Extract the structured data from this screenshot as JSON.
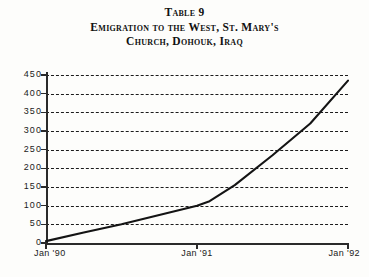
{
  "title": {
    "line1": "Table 9",
    "line2": "Emigration to the West, St. Mary's",
    "line3": "Church, Dohouk, Iraq"
  },
  "colors": {
    "line": "#141414",
    "grid": "#1b1b1b",
    "axis": "#2a2a2a",
    "background": "#fdfdfb",
    "text": "#111111"
  },
  "chart_data": {
    "type": "line",
    "title": "Emigration to the West, St. Mary's Church, Dohouk, Iraq",
    "table_number": "Table 9",
    "xlabel": "",
    "ylabel": "",
    "xlim": [
      "Jan '90",
      "Jan '92"
    ],
    "ylim": [
      0,
      450
    ],
    "ytick_labels": [
      "0",
      "50",
      "100",
      "150",
      "200",
      "250",
      "300",
      "350",
      "400",
      "450"
    ],
    "yticks": [
      0,
      50,
      100,
      150,
      200,
      250,
      300,
      350,
      400,
      450
    ],
    "xtick_labels": [
      "Jan '90",
      "Jan '91",
      "Jan '92"
    ],
    "xticks": [
      0,
      12,
      24
    ],
    "grid": "horizontal-dashed",
    "legend": null,
    "series": [
      {
        "name": "Emigration",
        "x": [
          0,
          3,
          6,
          9,
          12,
          13,
          15,
          18,
          21,
          24
        ],
        "x_labels": [
          "Jan '90",
          "Apr '90",
          "Jul '90",
          "Oct '90",
          "Jan '91",
          "Feb '91",
          "Apr '91",
          "Jul '91",
          "Oct '91",
          "Jan '92"
        ],
        "values": [
          5,
          28,
          50,
          75,
          100,
          112,
          155,
          235,
          320,
          435
        ]
      }
    ]
  }
}
